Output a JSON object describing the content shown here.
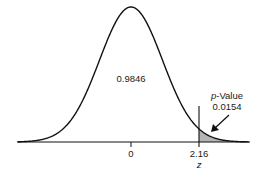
{
  "chart_data": {
    "type": "area",
    "title": "",
    "xlabel": "z",
    "ylabel": "",
    "distribution": "standard normal",
    "x_ticks": [
      {
        "value": 0,
        "label": "0"
      },
      {
        "value": 2.16,
        "label": "2.16"
      }
    ],
    "critical_value": 2.16,
    "regions": [
      {
        "name": "body",
        "area": 0.9846,
        "label": "0.9846",
        "range": [
          -3.5,
          2.16
        ],
        "shaded": false
      },
      {
        "name": "right-tail",
        "area": 0.0154,
        "label": "0.0154",
        "range": [
          2.16,
          3.7
        ],
        "shaded": true
      }
    ],
    "annotations": [
      {
        "text_prefix": "p",
        "text_suffix": "-Value",
        "value": "0.0154",
        "arrow_to": "right-tail"
      }
    ],
    "grid": false,
    "legend": null
  },
  "labels": {
    "body_area": "0.9846",
    "pvalue_prefix": "p",
    "pvalue_suffix": "-Value",
    "pvalue_value": "0.0154",
    "tick_zero": "0",
    "tick_crit": "2.16",
    "axis_label": "z"
  },
  "colors": {
    "curve": "#111111",
    "shade": "#b5b5b5",
    "axis": "#111111",
    "text": "#1a1a1a"
  }
}
